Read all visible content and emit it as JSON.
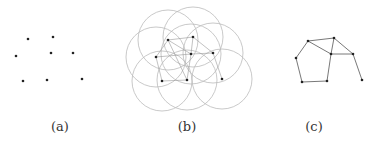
{
  "panels": [
    {
      "id": "a",
      "label": "(a)",
      "label_x": 60,
      "nodes": [
        [
          28,
          39
        ],
        [
          53,
          37
        ],
        [
          16,
          56
        ],
        [
          51,
          53
        ],
        [
          73,
          53
        ],
        [
          23,
          81
        ],
        [
          47,
          80
        ],
        [
          82,
          79
        ]
      ],
      "show_circles": false,
      "edges": []
    },
    {
      "id": "b",
      "label": "(b)",
      "label_x": 187,
      "nodes": [
        [
          168,
          40
        ],
        [
          193,
          37
        ],
        [
          156,
          57
        ],
        [
          191,
          54
        ],
        [
          213,
          53
        ],
        [
          162,
          81
        ],
        [
          187,
          80
        ],
        [
          222,
          79
        ]
      ],
      "show_circles": true,
      "radius": 30,
      "edges": [
        [
          0,
          1
        ],
        [
          0,
          3
        ],
        [
          1,
          3
        ],
        [
          1,
          4
        ],
        [
          3,
          4
        ],
        [
          0,
          2
        ],
        [
          2,
          5
        ],
        [
          5,
          6
        ],
        [
          6,
          3
        ],
        [
          4,
          7
        ],
        [
          0,
          6
        ],
        [
          2,
          3
        ]
      ]
    },
    {
      "id": "c",
      "label": "(c)",
      "label_x": 314,
      "nodes": [
        [
          308,
          41
        ],
        [
          334,
          38
        ],
        [
          296,
          58
        ],
        [
          331,
          54
        ],
        [
          353,
          54
        ],
        [
          302,
          82
        ],
        [
          327,
          81
        ],
        [
          362,
          80
        ]
      ],
      "show_circles": false,
      "edges": [
        [
          0,
          1
        ],
        [
          0,
          3
        ],
        [
          1,
          3
        ],
        [
          1,
          4
        ],
        [
          3,
          4
        ],
        [
          0,
          2
        ],
        [
          2,
          5
        ],
        [
          5,
          6
        ],
        [
          6,
          3
        ],
        [
          4,
          7
        ]
      ]
    }
  ],
  "colors": {
    "node": "#222222",
    "edge": "#555555",
    "circle": "#bbbbbb",
    "edge_faint": "#999999"
  }
}
